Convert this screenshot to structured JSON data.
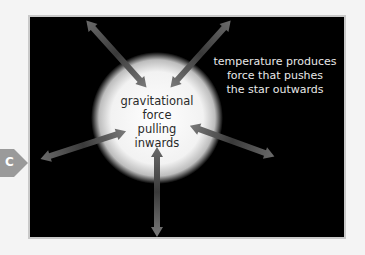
{
  "badge": {
    "label": "C",
    "color": "#9a9a9a"
  },
  "diagram": {
    "background": "#000000",
    "star": {
      "center": [
        157,
        118
      ],
      "radius": 62,
      "color": "#ffffff"
    },
    "labels": {
      "outward": [
        "temperature produces",
        "force that pushes",
        "the star outwards"
      ],
      "inward": [
        "gravitational",
        "force",
        "pulling",
        "inwards"
      ]
    },
    "arrow_color": "#8a8a8a",
    "arrow_count": 6
  }
}
